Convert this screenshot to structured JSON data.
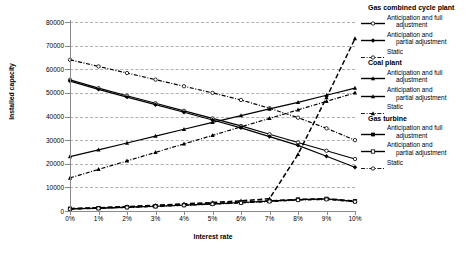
{
  "chart_data": {
    "type": "line",
    "title": "",
    "xlabel": "Interest rate",
    "ylabel": "Installed capacity",
    "x": [
      0,
      1,
      2,
      3,
      4,
      5,
      6,
      7,
      8,
      9,
      10
    ],
    "x_tick_labels": [
      "0%",
      "1%",
      "2%",
      "3%",
      "4%",
      "5%",
      "6%",
      "7%",
      "8%",
      "9%",
      "10%"
    ],
    "y_tick_labels": [
      "0",
      "10000",
      "20000",
      "30000",
      "40000",
      "50000",
      "60000",
      "70000",
      "80000"
    ],
    "y_ticks": [
      0,
      10000,
      20000,
      30000,
      40000,
      50000,
      60000,
      70000,
      80000
    ],
    "xlim": [
      0,
      10
    ],
    "ylim": [
      0,
      80000
    ],
    "grid": true,
    "legend_position": "right",
    "series": [
      {
        "name": "Gas combined cycle plant - Anticipation and full adjustment",
        "group": "Gas combined cycle plant",
        "variant": "Anticipation and full adjustment",
        "marker": "open-circle",
        "line": "solid",
        "values": [
          55500,
          52000,
          48800,
          45600,
          42400,
          39200,
          36000,
          32500,
          29000,
          25500,
          22000
        ]
      },
      {
        "name": "Gas combined cycle plant - Anticipation and partial adjustment",
        "group": "Gas combined cycle plant",
        "variant": "Anticipation and partial adjustment",
        "marker": "solid-diamond",
        "line": "solid",
        "values": [
          55000,
          51500,
          48200,
          45000,
          41800,
          38500,
          35200,
          31500,
          27800,
          23200,
          18500
        ]
      },
      {
        "name": "Gas combined cycle plant - Static",
        "group": "Gas combined cycle plant",
        "variant": "Static",
        "marker": "open-circle",
        "line": "dash-dot",
        "values": [
          64000,
          61200,
          58400,
          55600,
          52800,
          50000,
          47000,
          43500,
          39500,
          35000,
          30000
        ]
      },
      {
        "name": "Coal plant - Anticipation and full adjustment",
        "group": "Coal plant",
        "variant": "Anticipation and full adjustment",
        "marker": "solid-triangle",
        "line": "dashed",
        "values": [
          1000,
          1400,
          1900,
          2400,
          3000,
          3600,
          4300,
          5200,
          24000,
          48000,
          73000
        ]
      },
      {
        "name": "Coal plant - Anticipation and partial adjustment",
        "group": "Coal plant",
        "variant": "Anticipation and partial adjustment",
        "marker": "solid-triangle",
        "line": "solid",
        "values": [
          23000,
          25900,
          28800,
          31700,
          34600,
          37500,
          40400,
          43200,
          46000,
          49000,
          52000
        ]
      },
      {
        "name": "Coal plant - Static",
        "group": "Coal plant",
        "variant": "Static",
        "marker": "solid-triangle",
        "line": "dash-dot",
        "values": [
          14000,
          17600,
          21200,
          24800,
          28400,
          32000,
          35600,
          39200,
          42800,
          46400,
          50000
        ]
      },
      {
        "name": "Gas turbine - Anticipation and full adjustment",
        "group": "Gas turbine",
        "variant": "Anticipation and full adjustment",
        "marker": "solid-square",
        "line": "dashed",
        "values": [
          1000,
          1300,
          1700,
          2100,
          2600,
          3100,
          3700,
          4300,
          4900,
          5200,
          4200
        ]
      },
      {
        "name": "Gas turbine - Anticipation and partial adjustment",
        "group": "Gas turbine",
        "variant": "Anticipation and partial adjustment",
        "marker": "open-square",
        "line": "solid",
        "values": [
          900,
          1200,
          1600,
          2000,
          2500,
          3000,
          3600,
          4200,
          4800,
          5100,
          4100
        ]
      },
      {
        "name": "Gas turbine - Static",
        "group": "Gas turbine",
        "variant": "Static",
        "marker": "open-circle",
        "line": "dash-dot",
        "values": [
          800,
          1100,
          1500,
          1900,
          2400,
          2900,
          3400,
          4000,
          4600,
          4900,
          3900
        ]
      }
    ]
  },
  "legend": {
    "groups": [
      {
        "heading": "Gas combined cycle plant",
        "entries": [
          {
            "label_line1": "Anticipation and full",
            "label_line2": "adjustment",
            "marker": "open-circle",
            "line": "solid"
          },
          {
            "label_line1": "Anticipation and",
            "label_line2": "partial adjustment",
            "marker": "solid-diamond",
            "line": "solid"
          },
          {
            "label_line1": "Static",
            "label_line2": "",
            "marker": "open-circle",
            "line": "dash-dot"
          }
        ]
      },
      {
        "heading": "Coal plant",
        "entries": [
          {
            "label_line1": "Anticipation and full",
            "label_line2": "adjustment",
            "marker": "solid-triangle",
            "line": "solid"
          },
          {
            "label_line1": "Anticipation and",
            "label_line2": "partial adjustment",
            "marker": "solid-triangle",
            "line": "solid"
          },
          {
            "label_line1": "Static",
            "label_line2": "",
            "marker": "solid-triangle",
            "line": "dash-dot"
          }
        ]
      },
      {
        "heading": "Gas turbine",
        "entries": [
          {
            "label_line1": "Anticipation and full",
            "label_line2": "adjustment",
            "marker": "solid-square",
            "line": "solid"
          },
          {
            "label_line1": "Anticipation and",
            "label_line2": "partial adjustment",
            "marker": "open-square",
            "line": "solid"
          },
          {
            "label_line1": "Static",
            "label_line2": "",
            "marker": "open-circle",
            "line": "dash-dot"
          }
        ]
      }
    ]
  },
  "colors": {
    "series": "#000000",
    "grid": "#b0b0b0",
    "axis": "#8a8a8a",
    "background": "#ffffff"
  }
}
